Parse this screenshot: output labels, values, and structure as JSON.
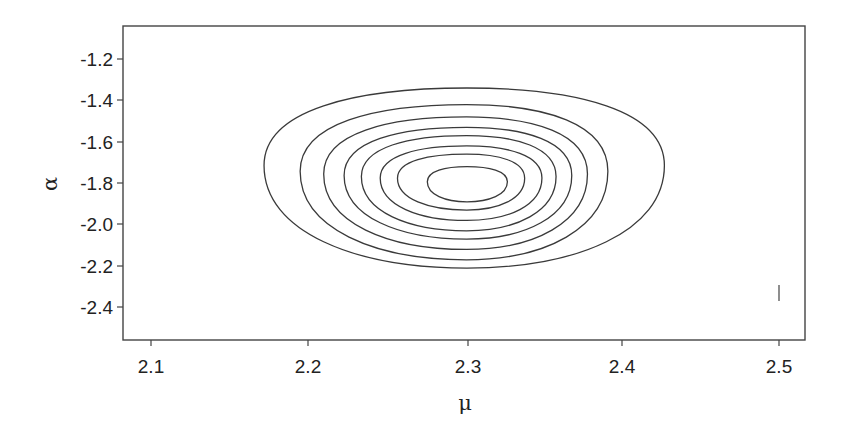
{
  "chart_data": {
    "type": "contour",
    "title": "",
    "xlabel": "μ",
    "ylabel": "α",
    "xlim": [
      2.085,
      2.52
    ],
    "ylim": [
      -2.56,
      -1.04
    ],
    "x_ticks": [
      2.1,
      2.2,
      2.3,
      2.4,
      2.5
    ],
    "x_tick_labels": [
      "2.1",
      "2.2",
      "2.3",
      "2.4",
      "2.5"
    ],
    "y_ticks": [
      -1.2,
      -1.4,
      -1.6,
      -1.8,
      -2.0,
      -2.2,
      -2.4
    ],
    "y_tick_labels": [
      "-1.2",
      "-1.4",
      "-1.6",
      "-1.8",
      "-2.0",
      "-2.2",
      "-2.4"
    ],
    "grid": false,
    "legend": null,
    "contour_levels": 8,
    "mode": {
      "mu": 2.3,
      "alpha": -1.8
    },
    "contours": [
      {
        "level_index": 1,
        "mu_range": [
          2.172,
          2.427
        ],
        "alpha_range": [
          -2.21,
          -1.34
        ]
      },
      {
        "level_index": 2,
        "mu_range": [
          2.195,
          2.391
        ],
        "alpha_range": [
          -2.17,
          -1.42
        ]
      },
      {
        "level_index": 3,
        "mu_range": [
          2.21,
          2.378
        ],
        "alpha_range": [
          -2.12,
          -1.48
        ]
      },
      {
        "level_index": 4,
        "mu_range": [
          2.223,
          2.368
        ],
        "alpha_range": [
          -2.07,
          -1.53
        ]
      },
      {
        "level_index": 5,
        "mu_range": [
          2.234,
          2.358
        ],
        "alpha_range": [
          -2.03,
          -1.57
        ]
      },
      {
        "level_index": 6,
        "mu_range": [
          2.246,
          2.349
        ],
        "alpha_range": [
          -1.98,
          -1.62
        ]
      },
      {
        "level_index": 7,
        "mu_range": [
          2.257,
          2.338
        ],
        "alpha_range": [
          -1.93,
          -1.66
        ]
      },
      {
        "level_index": 8,
        "mu_range": [
          2.276,
          2.327
        ],
        "alpha_range": [
          -1.89,
          -1.72
        ]
      }
    ],
    "annotations": [
      {
        "type": "vertical-mark",
        "mu": 2.5,
        "alpha_range": [
          -2.51,
          -2.43
        ]
      }
    ]
  }
}
